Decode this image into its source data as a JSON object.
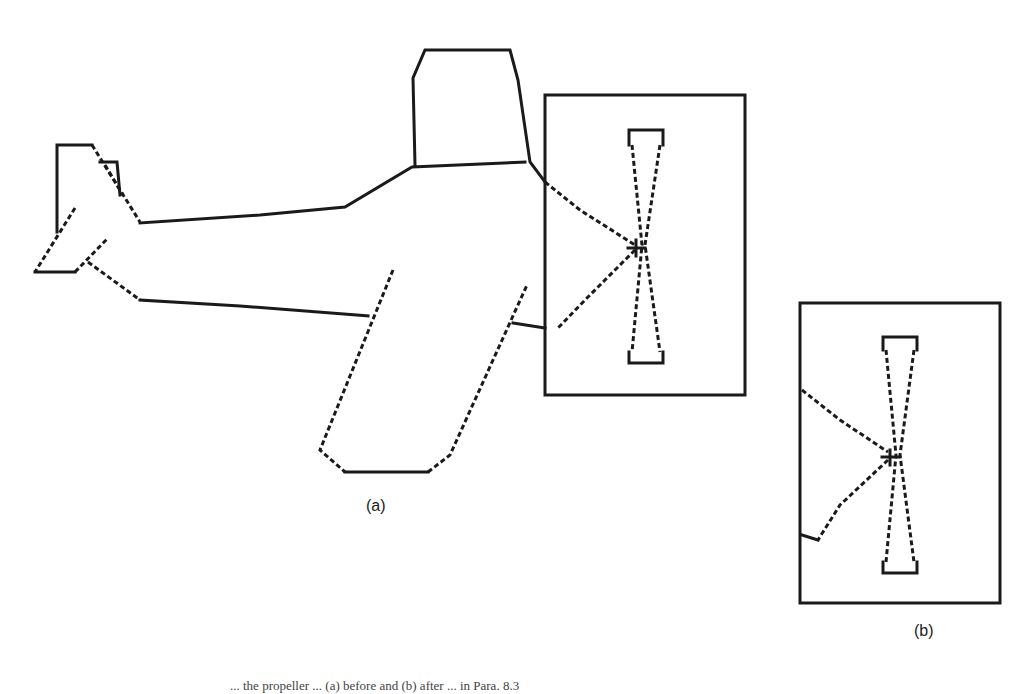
{
  "figure": {
    "panels": [
      {
        "label": "(a)",
        "content": "aircraft outline with propeller enclosed in a bounding window"
      },
      {
        "label": "(b)",
        "content": "enlarged view of the windowed propeller region"
      }
    ],
    "caption": "... the propeller ... (a) before and (b) after ... in Para. 8.3",
    "ink_color": "#1a1a1a",
    "background_color": "#ffffff"
  }
}
